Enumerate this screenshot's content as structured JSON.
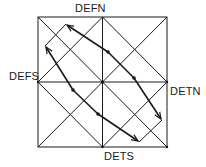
{
  "labels": {
    "top": "DEFN",
    "left": "DEFS",
    "right": "DETN",
    "bottom": "DETS"
  },
  "colors": {
    "line": "#1a1a1a",
    "background": "#ffffff"
  },
  "diagram": {
    "square": {
      "x0": 38,
      "y0": 17,
      "x1": 167,
      "y1": 147
    },
    "path_vertices": [
      [
        66,
        24
      ],
      [
        45,
        46
      ],
      [
        162,
        120
      ],
      [
        139,
        142
      ]
    ],
    "dots": [
      [
        108,
        52
      ],
      [
        134,
        78
      ],
      [
        73,
        90
      ],
      [
        98,
        114
      ],
      [
        102,
        82
      ]
    ],
    "arrows": [
      {
        "from": [
          108,
          52
        ],
        "to": [
          66,
          24
        ]
      },
      {
        "from": [
          73,
          90
        ],
        "to": [
          45,
          46
        ]
      },
      {
        "from": [
          134,
          78
        ],
        "to": [
          162,
          120
        ]
      },
      {
        "from": [
          98,
          114
        ],
        "to": [
          139,
          142
        ]
      }
    ]
  }
}
